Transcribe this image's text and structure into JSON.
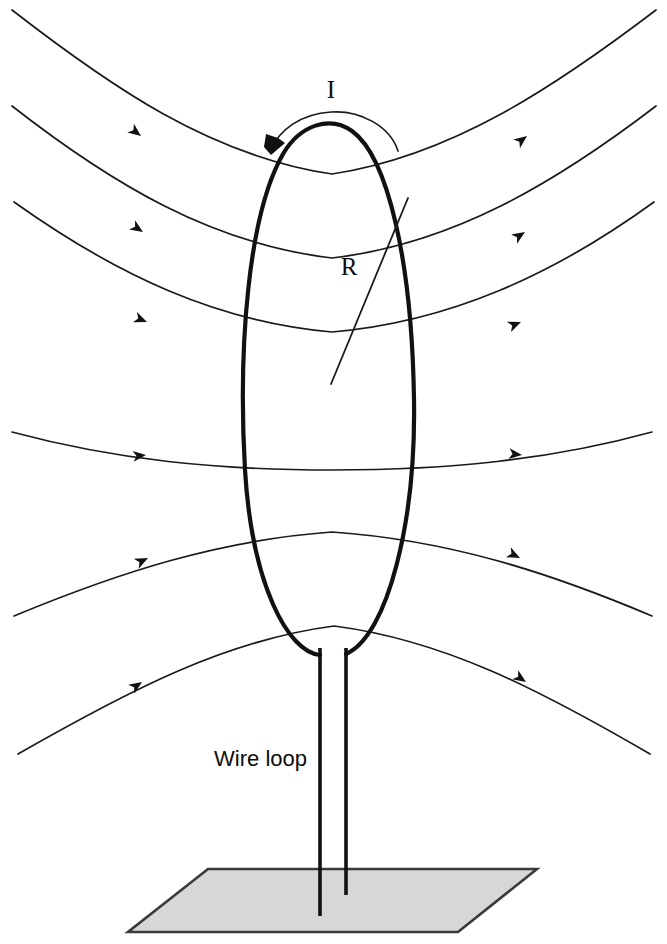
{
  "figure": {
    "background_color": "#ffffff",
    "width": 667,
    "height": 944
  },
  "labels": {
    "current": "I",
    "radius": "R",
    "wire_loop": "Wire loop"
  },
  "colors": {
    "ink": "#111111",
    "field_line": "#1a1a1a",
    "ground_fill": "#d7d7d7",
    "ground_stroke": "#3a3a3a",
    "background": "#ffffff"
  },
  "loop": {
    "name": "wire-loop",
    "center_x": 330,
    "center_y": 382,
    "top_y": 124,
    "bottom_y": 648,
    "left_x": 243,
    "right_x": 416,
    "path": "M 320 655 C 288 652 252 585 245 470 C 238 348 248 215 283 154 C 300 125 330 115 352 131 C 388 157 412 262 414 400 C 416 520 388 636 346 654"
  },
  "radius_indicator": {
    "name": "radius-line",
    "from_x": 331,
    "from_y": 384,
    "to_x": 408,
    "to_y": 198,
    "label_x": 349,
    "label_y": 275
  },
  "current_indicator": {
    "name": "current-arc",
    "direction": "counterclockwise",
    "arc_path": "M 398 151 C 390 126 360 110 331 112 C 300 114 280 130 271 149",
    "arrow_head_points": "271,155 285,143 278,138 266,134 264,147",
    "label_x": 331,
    "label_y": 98
  },
  "leads": {
    "name": "lead-wires",
    "left_x": 320,
    "right_x": 346,
    "top_y": 648,
    "left_bottom_y": 916,
    "right_bottom_y": 895
  },
  "ground_plane": {
    "name": "ground-plane",
    "points": "208,869 537,869 458,932 128,932"
  },
  "chart_data": {
    "type": "diagram",
    "elements": [
      "wire loop carrying current I",
      "loop radius R",
      "six magnetic field lines with direction arrows",
      "two vertical lead wires",
      "shaded ground plane"
    ],
    "field_line_count": 6,
    "field_line_direction": "left to right (arrows point rightward)",
    "field_lines": [
      {
        "index": 1,
        "path": "M 12 10 C 110 86 210 156 332 174 C 452 156 556 86 656 10",
        "arrow": {
          "x": 141,
          "y": 136,
          "angle": 37
        },
        "arrow2": {
          "x": 527,
          "y": 136,
          "angle": -37
        }
      },
      {
        "index": 2,
        "path": "M 12 106 C 112 184 212 244 332 258 C 452 244 554 184 656 106",
        "arrow": {
          "x": 143,
          "y": 232,
          "angle": 33
        },
        "arrow2": {
          "x": 525,
          "y": 232,
          "angle": -33
        }
      },
      {
        "index": 3,
        "path": "M 14 202 C 118 276 218 322 332 332 C 448 322 552 276 654 202",
        "arrow": {
          "x": 147,
          "y": 322,
          "angle": 22
        },
        "arrow2": {
          "x": 521,
          "y": 322,
          "angle": -22
        }
      },
      {
        "index": 4,
        "path": "M 12 432 C 116 460 218 470 332 470 C 448 470 550 460 652 432",
        "arrow": {
          "x": 146,
          "y": 455,
          "angle": -6
        },
        "arrow2": {
          "x": 522,
          "y": 455,
          "angle": 6
        }
      },
      {
        "index": 5,
        "path": "M 14 616 C 120 572 220 540 332 532 C 448 540 548 572 652 616",
        "arrow": {
          "x": 148,
          "y": 558,
          "angle": -26
        },
        "arrow2": {
          "x": 520,
          "y": 558,
          "angle": 26
        }
      },
      {
        "index": 6,
        "path": "M 18 754 C 130 690 226 640 334 626 C 444 640 540 690 650 754",
        "arrow": {
          "x": 142,
          "y": 682,
          "angle": -34
        },
        "arrow2": {
          "x": 526,
          "y": 682,
          "angle": 34
        }
      }
    ]
  }
}
